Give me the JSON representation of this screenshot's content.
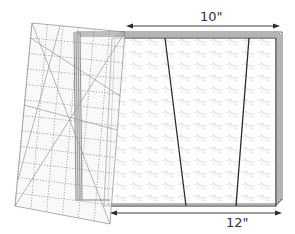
{
  "diagram": {
    "colors": {
      "background": "#ffffff",
      "outline": "#2b2b2b",
      "ruler_grid": "#8a8a8a",
      "ruler_fill": "#f6f6f6",
      "fabric_pattern": "#c8c8c8",
      "layer_edge": "#6a6a6a",
      "arrow": "#2b2b2b"
    },
    "top_dimension": {
      "label": "10\""
    },
    "bottom_dimension": {
      "label": "12\""
    }
  }
}
